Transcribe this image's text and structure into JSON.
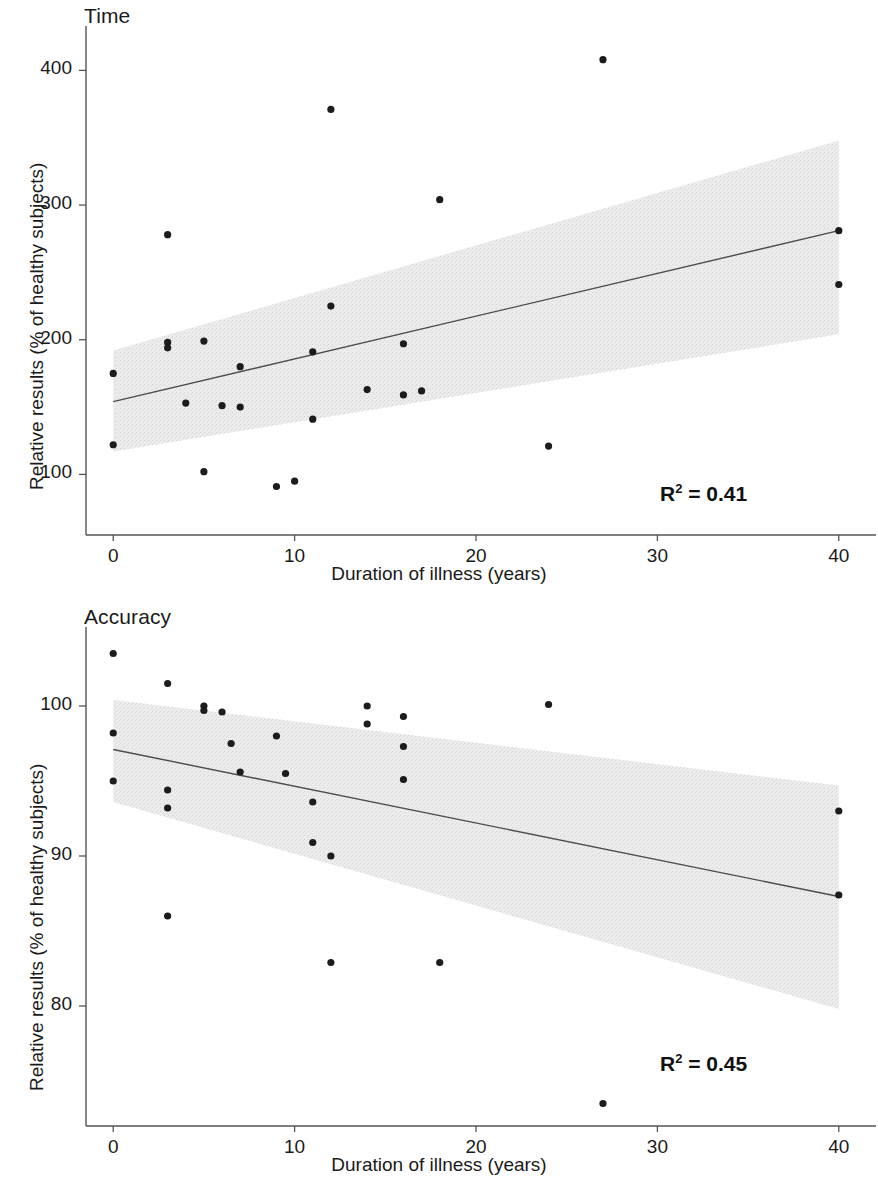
{
  "figure": {
    "background": "#ffffff",
    "point_color": "#1c1c1c",
    "line_color": "#4d4d4d",
    "band_color": "#e8e8e8",
    "axis_color": "#555555"
  },
  "panels": [
    {
      "id": "time",
      "title": "Time",
      "r2_prefix": "R",
      "r2_exponent": "2",
      "r2_value": " = 0.41",
      "xlabel": "Duration of illness (years)",
      "ylabel": "Relative results (% of healthy subjects)",
      "xticks": [
        "0",
        "10",
        "20",
        "30",
        "40"
      ],
      "yticks": [
        "400",
        "300",
        "200",
        "100"
      ]
    },
    {
      "id": "accuracy",
      "title": "Accuracy",
      "r2_prefix": "R",
      "r2_exponent": "2",
      "r2_value": " = 0.45",
      "xlabel": "Duration of illness (years)",
      "ylabel": "Relative results (% of healthy subjects)",
      "xticks": [
        "0",
        "10",
        "20",
        "30",
        "40"
      ],
      "yticks": [
        "100",
        "90",
        "80"
      ]
    }
  ],
  "chart_data": [
    {
      "type": "scatter",
      "title": "Time",
      "xlabel": "Duration of illness (years)",
      "ylabel": "Relative results (% of healthy subjects)",
      "xlim": [
        -1.5,
        41.5
      ],
      "ylim": [
        55,
        430
      ],
      "xticks": [
        0,
        10,
        20,
        30,
        40
      ],
      "yticks": [
        100,
        200,
        300,
        400
      ],
      "grid": false,
      "legend": null,
      "annotations": [
        {
          "text": "R² = 0.41",
          "x": 33,
          "y": 88
        }
      ],
      "points": [
        {
          "x": 0,
          "y": 175
        },
        {
          "x": 0,
          "y": 122
        },
        {
          "x": 3,
          "y": 278
        },
        {
          "x": 3,
          "y": 198
        },
        {
          "x": 3,
          "y": 194
        },
        {
          "x": 4,
          "y": 153
        },
        {
          "x": 5,
          "y": 199
        },
        {
          "x": 5,
          "y": 102
        },
        {
          "x": 6,
          "y": 151
        },
        {
          "x": 7,
          "y": 180
        },
        {
          "x": 7,
          "y": 150
        },
        {
          "x": 9,
          "y": 91
        },
        {
          "x": 10,
          "y": 95
        },
        {
          "x": 11,
          "y": 191
        },
        {
          "x": 11,
          "y": 141
        },
        {
          "x": 12,
          "y": 371
        },
        {
          "x": 12,
          "y": 225
        },
        {
          "x": 14,
          "y": 163
        },
        {
          "x": 16,
          "y": 197
        },
        {
          "x": 16,
          "y": 159
        },
        {
          "x": 17,
          "y": 162
        },
        {
          "x": 18,
          "y": 304
        },
        {
          "x": 24,
          "y": 121
        },
        {
          "x": 27,
          "y": 408
        },
        {
          "x": 40,
          "y": 281
        },
        {
          "x": 40,
          "y": 241
        }
      ],
      "fit_line": {
        "x": [
          0,
          40
        ],
        "y": [
          154,
          281
        ]
      },
      "confidence_band": {
        "x": [
          0,
          40
        ],
        "upper": [
          192,
          348
        ],
        "lower": [
          117,
          204
        ]
      }
    },
    {
      "type": "scatter",
      "title": "Accuracy",
      "xlabel": "Duration of illness (years)",
      "ylabel": "Relative results (% of healthy subjects)",
      "xlim": [
        -1.5,
        41.5
      ],
      "ylim": [
        72,
        105
      ],
      "xticks": [
        0,
        10,
        20,
        30,
        40
      ],
      "yticks": [
        80,
        90,
        100
      ],
      "grid": false,
      "legend": null,
      "annotations": [
        {
          "text": "R² = 0.45",
          "x": 33,
          "y": 76.5
        }
      ],
      "points": [
        {
          "x": 0,
          "y": 103.5
        },
        {
          "x": 0,
          "y": 98.2
        },
        {
          "x": 0,
          "y": 95.0
        },
        {
          "x": 3,
          "y": 101.5
        },
        {
          "x": 3,
          "y": 94.4
        },
        {
          "x": 3,
          "y": 93.2
        },
        {
          "x": 3,
          "y": 86.0
        },
        {
          "x": 5,
          "y": 100.0
        },
        {
          "x": 5,
          "y": 99.7
        },
        {
          "x": 6,
          "y": 99.6
        },
        {
          "x": 6.5,
          "y": 97.5
        },
        {
          "x": 7,
          "y": 95.6
        },
        {
          "x": 9,
          "y": 98.0
        },
        {
          "x": 9.5,
          "y": 95.5
        },
        {
          "x": 11,
          "y": 93.6
        },
        {
          "x": 11,
          "y": 90.9
        },
        {
          "x": 12,
          "y": 90.0
        },
        {
          "x": 12,
          "y": 82.9
        },
        {
          "x": 14,
          "y": 100.0
        },
        {
          "x": 14,
          "y": 98.8
        },
        {
          "x": 16,
          "y": 99.3
        },
        {
          "x": 16,
          "y": 95.1
        },
        {
          "x": 16,
          "y": 97.3
        },
        {
          "x": 18,
          "y": 82.9
        },
        {
          "x": 24,
          "y": 100.1
        },
        {
          "x": 27,
          "y": 73.5
        },
        {
          "x": 40,
          "y": 93.0
        },
        {
          "x": 40,
          "y": 87.4
        }
      ],
      "fit_line": {
        "x": [
          0,
          40
        ],
        "y": [
          97.1,
          87.3
        ]
      },
      "confidence_band": {
        "x": [
          0,
          40
        ],
        "upper": [
          100.4,
          94.7
        ],
        "lower": [
          93.6,
          79.8
        ]
      }
    }
  ]
}
